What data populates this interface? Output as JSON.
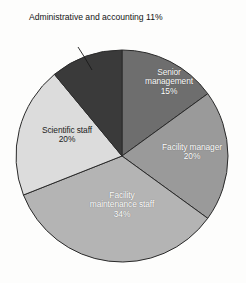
{
  "chart_data": {
    "type": "pie",
    "title": "",
    "subtitle": "",
    "xlabel": "",
    "ylabel": "",
    "legend_position": "none",
    "grid": false,
    "units": "percent",
    "start_angle_deg": 0,
    "direction": "clockwise",
    "categories": [
      "Senior management",
      "Facility manager",
      "Facility maintenance staff",
      "Scientific staff",
      "Administrative and accounting"
    ],
    "values": [
      15,
      20,
      34,
      20,
      11
    ],
    "slices": [
      {
        "label": "Senior management",
        "label_line1": "Senior",
        "label_line2": "management",
        "value": 15,
        "value_text": "15%",
        "color": "#6e6e6e",
        "label_placement": "inside",
        "label_text_color": "#ffffff",
        "start_deg": 0,
        "end_deg": 54
      },
      {
        "label": "Facility manager",
        "label_line1": "Facility manager",
        "label_line2": "",
        "value": 20,
        "value_text": "20%",
        "color": "#9a9a9a",
        "label_placement": "inside",
        "label_text_color": "#ffffff",
        "start_deg": 54,
        "end_deg": 126
      },
      {
        "label": "Facility maintenance staff",
        "label_line1": "Facility",
        "label_line2": "maintenance staff",
        "value": 34,
        "value_text": "34%",
        "color": "#b4b4b4",
        "label_placement": "inside",
        "label_text_color": "#ffffff",
        "start_deg": 126,
        "end_deg": 248.4
      },
      {
        "label": "Scientific staff",
        "label_line1": "Scientific staff",
        "label_line2": "",
        "value": 20,
        "value_text": "20%",
        "color": "#dcdcdc",
        "label_placement": "inside",
        "label_text_color": "#1c1c1c",
        "start_deg": 248.4,
        "end_deg": 320.4
      },
      {
        "label": "Administrative and accounting",
        "label_line1": "Administrative",
        "label_line2": "and accounting",
        "value": 11,
        "value_text": "11%",
        "color": "#3a3a3a",
        "label_placement": "outside",
        "label_text_color": "#141414",
        "start_deg": 320.4,
        "end_deg": 360
      }
    ]
  },
  "geometry": {
    "center_x": 122,
    "center_y": 156,
    "radius": 106,
    "border_color": "#2a2a2a",
    "border_width": 1,
    "background": "#fdfdfc",
    "leader_line_color": "#1a1a1a"
  },
  "labels": {
    "senior_management": {
      "line1": "Senior",
      "line2": "management",
      "value": "15%"
    },
    "facility_manager": {
      "line1": "Facility manager",
      "value": "20%"
    },
    "facility_maintenance_staff": {
      "line1": "Facility",
      "line2": "maintenance staff",
      "value": "34%"
    },
    "scientific_staff": {
      "line1": "Scientific staff",
      "value": "20%"
    },
    "administrative_accounting": {
      "line1": "Administrative",
      "line2": "and accounting",
      "value": "11%"
    }
  }
}
